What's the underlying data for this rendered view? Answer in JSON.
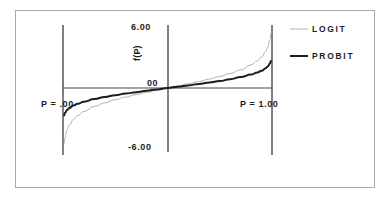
{
  "chart_data": {
    "type": "line",
    "title": "",
    "subtitle": "",
    "xlabel": "",
    "ylabel": "f(P)",
    "xlim": [
      0,
      1
    ],
    "ylim": [
      -6.0,
      6.0
    ],
    "grid": false,
    "legend_position": "right",
    "axis_labels": {
      "y_max": "6.00",
      "y_zero": "00",
      "y_min": "-6.00",
      "y_title": "f(P)",
      "x_min": "P = .00",
      "x_max": "P = 1.00"
    },
    "annotations": [
      {
        "text": "P = .00",
        "position": "left-axis"
      },
      {
        "text": "P = 1.00",
        "position": "right-axis"
      }
    ],
    "x": [
      0.005,
      0.01,
      0.02,
      0.03,
      0.05,
      0.07,
      0.1,
      0.15,
      0.2,
      0.25,
      0.3,
      0.35,
      0.4,
      0.45,
      0.5,
      0.55,
      0.6,
      0.65,
      0.7,
      0.75,
      0.8,
      0.85,
      0.9,
      0.93,
      0.95,
      0.97,
      0.98,
      0.99,
      0.995
    ],
    "series": [
      {
        "name": "LOGIT",
        "color": "#b3b3b3",
        "width": 1,
        "values": [
          -5.29,
          -4.6,
          -3.89,
          -3.48,
          -2.94,
          -2.59,
          -2.2,
          -1.73,
          -1.39,
          -1.1,
          -0.85,
          -0.62,
          -0.41,
          -0.2,
          0.0,
          0.2,
          0.41,
          0.62,
          0.85,
          1.1,
          1.39,
          1.73,
          2.2,
          2.59,
          2.94,
          3.48,
          3.89,
          4.6,
          5.29
        ]
      },
      {
        "name": "PROBIT",
        "color": "#1d1d1d",
        "width": 2,
        "values": [
          -2.58,
          -2.33,
          -2.05,
          -1.88,
          -1.64,
          -1.48,
          -1.28,
          -1.04,
          -0.84,
          -0.67,
          -0.52,
          -0.39,
          -0.25,
          -0.13,
          0.0,
          0.13,
          0.25,
          0.39,
          0.52,
          0.67,
          0.84,
          1.04,
          1.28,
          1.48,
          1.64,
          1.88,
          2.05,
          2.33,
          2.58
        ]
      }
    ]
  },
  "legend": {
    "entries": [
      {
        "label": "LOGIT",
        "color": "#b3b3b3"
      },
      {
        "label": "PROBIT",
        "color": "#1d1d1d"
      }
    ]
  },
  "colors": {
    "logit": "#b3b3b3",
    "probit": "#1d1d1d",
    "axis": "#4a4a4a",
    "frame": "#a8a8a8",
    "background": "#ffffff"
  }
}
